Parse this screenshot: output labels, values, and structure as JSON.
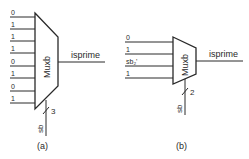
{
  "diagram_a": {
    "caption": "(a)",
    "mux_label": "Muxb",
    "output_label": "isprime",
    "inputs": [
      "0",
      "1",
      "1",
      "1",
      "0",
      "1",
      "0",
      "1"
    ],
    "select_label": "sb",
    "select_width": "3"
  },
  "diagram_b": {
    "caption": "(b)",
    "mux_label": "Muxb",
    "output_label": "isprime",
    "inputs": [
      "0",
      "1",
      "sb₂'",
      "1"
    ],
    "select_label": "sb",
    "select_width": "2"
  },
  "colors": {
    "line": "#2a2a2a",
    "background": "#ffffff"
  }
}
